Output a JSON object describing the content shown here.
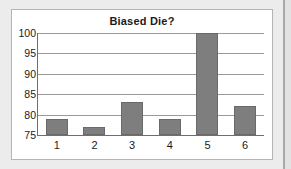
{
  "chart_data": {
    "type": "bar",
    "title": "Biased Die?",
    "xlabel": "",
    "ylabel": "",
    "categories": [
      "1",
      "2",
      "3",
      "4",
      "5",
      "6"
    ],
    "values": [
      79,
      77,
      83,
      79,
      100,
      82
    ],
    "ylim": [
      75,
      100
    ],
    "yticks": [
      75,
      80,
      85,
      90,
      95,
      100
    ],
    "ytick_labels": [
      "75",
      "80",
      "85",
      "90",
      "95",
      "100"
    ],
    "grid": true,
    "legend": null,
    "series": [
      {
        "name": "Observed counts",
        "values": [
          79,
          77,
          83,
          79,
          100,
          82
        ]
      }
    ]
  },
  "style": {
    "bar_color": "#7e7e7e",
    "bar_border_color": "#6a6a6a",
    "gridline_color": "#9a9a9a",
    "axis_color": "#6e6e6e",
    "plot_background": "#ffffff",
    "page_background": "#e8e8e8",
    "frame_border_color": "#b4b4b4",
    "text_color": "#1a1a1a"
  }
}
